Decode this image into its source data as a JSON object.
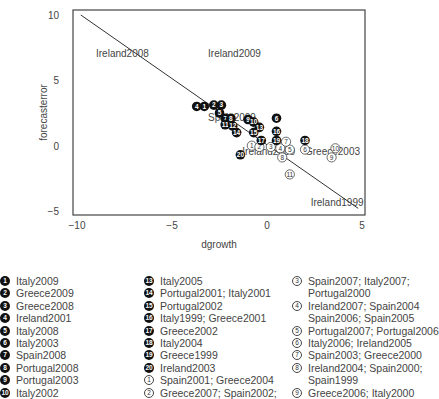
{
  "chart_data": {
    "type": "scatter",
    "title": "",
    "xlabel": "dgrowth",
    "ylabel": "forecasterror",
    "xlim": [
      -10,
      5
    ],
    "ylim": [
      -5,
      10
    ],
    "xticks": [
      -10,
      -5,
      0,
      5
    ],
    "yticks": [
      -5,
      0,
      5,
      10
    ],
    "xtick_labels": [
      "−10",
      "−5",
      "0",
      "5"
    ],
    "ytick_labels": [
      "−5",
      "0",
      "5",
      "10"
    ],
    "grid": false,
    "fit_line": {
      "x": [
        -9.8,
        4.8
      ],
      "y": [
        10.0,
        -4.8
      ]
    },
    "text_labels": [
      {
        "text": "Ireland2008",
        "x": -9.0,
        "y": 7.0
      },
      {
        "text": "Ireland2009",
        "x": -3.1,
        "y": 7.0
      },
      {
        "text": "Spain2009",
        "x": -3.1,
        "y": 2.1
      },
      {
        "text": "Ireland2000",
        "x": -1.3,
        "y": -0.5
      },
      {
        "text": "Greece2003",
        "x": 2.0,
        "y": -0.5
      },
      {
        "text": "Ireland1999",
        "x": 2.3,
        "y": -4.4
      }
    ],
    "filled_markers": [
      {
        "id": 1,
        "x": -3.3,
        "y": 3.0
      },
      {
        "id": 2,
        "x": -2.8,
        "y": 3.1
      },
      {
        "id": 3,
        "x": -2.4,
        "y": 3.1
      },
      {
        "id": 4,
        "x": -3.7,
        "y": 3.0
      },
      {
        "id": 5,
        "x": -2.5,
        "y": 2.5
      },
      {
        "id": 6,
        "x": 0.5,
        "y": 2.1
      },
      {
        "id": 7,
        "x": -2.2,
        "y": 2.1
      },
      {
        "id": 8,
        "x": -1.9,
        "y": 2.1
      },
      {
        "id": 9,
        "x": -1.0,
        "y": 2.0
      },
      {
        "id": 10,
        "x": -0.7,
        "y": 1.8
      },
      {
        "id": 11,
        "x": -2.2,
        "y": 1.6
      },
      {
        "id": 12,
        "x": -1.8,
        "y": 1.5
      },
      {
        "id": 13,
        "x": -0.4,
        "y": 1.4
      },
      {
        "id": 14,
        "x": -1.6,
        "y": 1.0
      },
      {
        "id": 15,
        "x": -0.7,
        "y": 1.0
      },
      {
        "id": 16,
        "x": 0.5,
        "y": 1.1
      },
      {
        "id": 17,
        "x": -0.3,
        "y": 0.4
      },
      {
        "id": 18,
        "x": 2.0,
        "y": 0.4
      },
      {
        "id": 19,
        "x": 0.5,
        "y": 0.4
      },
      {
        "id": 20,
        "x": -1.4,
        "y": -0.7
      }
    ],
    "open_markers": [
      {
        "id": 1,
        "x": -0.8,
        "y": 0.0
      },
      {
        "id": 2,
        "x": -0.4,
        "y": -0.1
      },
      {
        "id": 3,
        "x": 0.2,
        "y": -0.1
      },
      {
        "id": 4,
        "x": 0.7,
        "y": -0.2
      },
      {
        "id": 5,
        "x": 1.2,
        "y": -0.3
      },
      {
        "id": 6,
        "x": 2.0,
        "y": -0.3
      },
      {
        "id": 7,
        "x": 1.0,
        "y": 0.3
      },
      {
        "id": 8,
        "x": 0.8,
        "y": -0.9
      },
      {
        "id": 9,
        "x": 3.4,
        "y": -0.9
      },
      {
        "id": 10,
        "x": 3.6,
        "y": -0.2
      },
      {
        "id": 11,
        "x": 1.2,
        "y": -2.2
      }
    ],
    "legend": {
      "filled": [
        "Italy2009",
        "Greece2009",
        "Greece2008",
        "Ireland2001",
        "Italy2008",
        "Italy2003",
        "Spain2008",
        "Portugal2008",
        "Portugal2003",
        "Italy2002",
        "",
        "",
        "Italy2005",
        "Portugal2001; Italy2001",
        "Portugal2002",
        "Italy1999; Greece2001",
        "Greece2002",
        "Italy2004",
        "Greece1999",
        "Ireland2003"
      ],
      "open": [
        "Spain2001; Greece2004",
        "Greece2007; Spain2002;",
        "Spain2007; Italy2007;\nPortugal2000",
        "Ireland2007; Spain2004\nSpain2006; Spain2005",
        "Portugal2007; Portugal2006",
        "Italy2006; Ireland2005",
        "Spain2003; Greece2000",
        "Ireland2004; Spain2000;\nSpain1999",
        "Greece2006; Italy2000"
      ]
    }
  },
  "colors": {
    "marker_fill": "#111111",
    "marker_text": "#ffffff",
    "open_marker_stroke": "#444444",
    "axis": "#444444",
    "line": "#333333",
    "text": "#444444"
  }
}
